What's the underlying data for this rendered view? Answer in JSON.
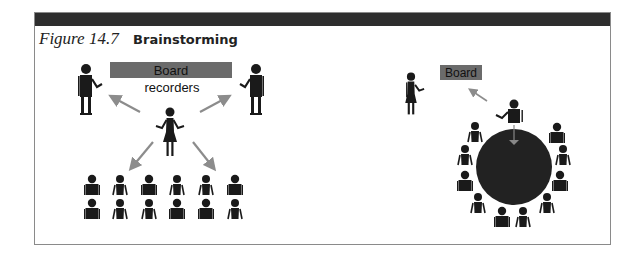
{
  "figure": {
    "number": "Figure 14.7",
    "title": "Brainstorming"
  },
  "left_scene": {
    "board_label": "Board",
    "recorders_label": "recorders",
    "board_color": "#6b6b6b",
    "arrow_color": "#8c8c8c",
    "audience_rows": 2,
    "audience_cols": 6
  },
  "right_scene": {
    "board_label": "Board",
    "board_color": "#6b6b6b",
    "table_color": "#222222",
    "participants_around_table": 12
  },
  "colors": {
    "header_bar": "#2e2e2e",
    "figure_ink": "#1a1a1a",
    "frame_border": "#8a8a8a"
  }
}
